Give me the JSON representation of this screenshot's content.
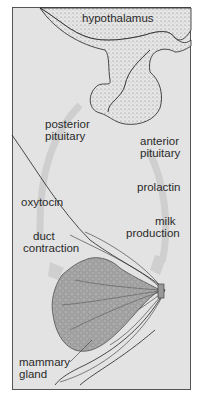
{
  "diagram": {
    "labels": {
      "hypothalamus": "hypothalamus",
      "posterior_pituitary_1": "posterior",
      "posterior_pituitary_2": "pituitary",
      "anterior_pituitary_1": "anterior",
      "anterior_pituitary_2": "pituitary",
      "prolactin": "prolactin",
      "milk_production_1": "milk",
      "milk_production_2": "production",
      "oxytocin": "oxytocin",
      "duct_contraction_1": "duct",
      "duct_contraction_2": "contraction",
      "mammary_gland_1": "mammary",
      "mammary_gland_2": "gland"
    },
    "colors": {
      "background": "#e3e3e3",
      "outline": "#222222",
      "arrow": "#cfcfcf",
      "gland_fill": "#a9a9a9"
    }
  }
}
